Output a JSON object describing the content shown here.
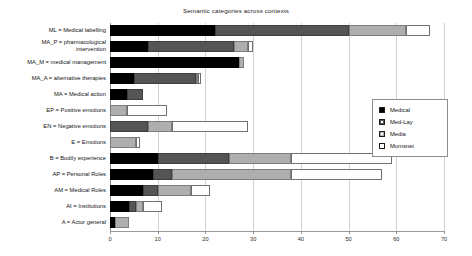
{
  "chart_data": {
    "type": "bar",
    "orientation": "horizontal",
    "stacked": true,
    "title": "Semantic categories across contexts",
    "xlabel": "",
    "ylabel": "",
    "xlim": [
      0,
      70
    ],
    "xticks": [
      0,
      10,
      20,
      30,
      40,
      50,
      60,
      70
    ],
    "grid": true,
    "legend_position": "right",
    "categories": [
      "ML = Medical labelling",
      "MA_P = pharmacological\nintervention",
      "MA_M = medical management",
      "MA_A = alternative therapies",
      "MA = Medical action",
      "EP = Positive emotions",
      "EN = Negative emotions",
      "E = Emotions",
      "B = Bodily experience",
      "AP = Personal Roles",
      "AM  = Medical Roles",
      "AI  = Institutions",
      "A = Actor general"
    ],
    "series": [
      {
        "name": "Medical",
        "color": "#000000",
        "values": [
          22,
          8,
          27,
          5,
          3.5,
          0,
          0,
          0,
          10,
          9,
          7,
          4,
          1
        ]
      },
      {
        "name": "Med-Lay",
        "color": "#555555",
        "values": [
          28,
          18,
          0,
          13,
          3.5,
          0,
          8,
          0,
          15,
          4,
          3,
          1.5,
          0
        ]
      },
      {
        "name": "Media",
        "color": "#aeaeae",
        "values": [
          12,
          3,
          1,
          0.5,
          0,
          3.5,
          5,
          5.5,
          13,
          25,
          7,
          1.5,
          3
        ]
      },
      {
        "name": "Mumsnet",
        "color": "#ffffff",
        "values": [
          5,
          1,
          0,
          0.5,
          0,
          8.5,
          16,
          0.8,
          21,
          19,
          4,
          4,
          0
        ]
      }
    ],
    "totals": [
      67,
      30,
      28,
      19,
      7,
      12,
      29,
      6.3,
      59,
      57,
      21,
      11,
      4
    ]
  },
  "legend": {
    "entries": [
      {
        "label": "Medical",
        "swatch": "medical-swatch"
      },
      {
        "label": "Med-Lay",
        "swatch": "med-lay-swatch"
      },
      {
        "label": "Media",
        "swatch": "media-swatch"
      },
      {
        "label": "Mumsnet",
        "swatch": "mumsnet-swatch"
      }
    ]
  }
}
